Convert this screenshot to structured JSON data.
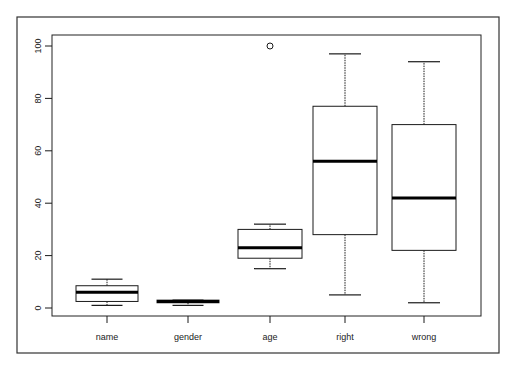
{
  "chart_data": {
    "type": "boxplot",
    "title": "",
    "xlabel": "",
    "ylabel": "",
    "ylim": [
      0,
      100
    ],
    "yticks": [
      0,
      20,
      40,
      60,
      80,
      100
    ],
    "grid": false,
    "legend": null,
    "categories": [
      "name",
      "gender",
      "age",
      "right",
      "wrong"
    ],
    "series": [
      {
        "name": "name",
        "whisker_low": 1,
        "q1": 2.5,
        "median": 6,
        "q3": 8.5,
        "whisker_high": 11,
        "outliers": []
      },
      {
        "name": "gender",
        "whisker_low": 1,
        "q1": 2,
        "median": 2.5,
        "q3": 3,
        "whisker_high": 3,
        "outliers": []
      },
      {
        "name": "age",
        "whisker_low": 15,
        "q1": 19,
        "median": 23,
        "q3": 30,
        "whisker_high": 32,
        "outliers": [
          100
        ]
      },
      {
        "name": "right",
        "whisker_low": 5,
        "q1": 28,
        "median": 56,
        "q3": 77,
        "whisker_high": 97,
        "outliers": []
      },
      {
        "name": "wrong",
        "whisker_low": 2,
        "q1": 22,
        "median": 42,
        "q3": 70,
        "whisker_high": 94,
        "outliers": []
      }
    ]
  },
  "colors": {
    "line": "#1a1a1a",
    "background": "#ffffff"
  }
}
